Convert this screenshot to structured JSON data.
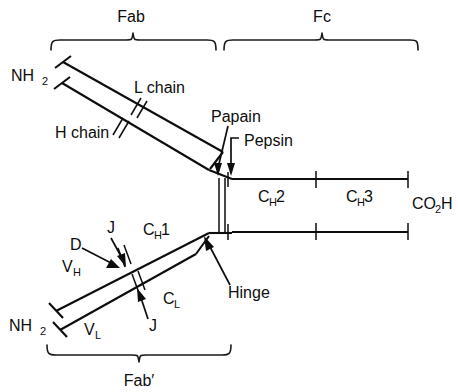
{
  "figure": {
    "type": "diagram",
    "background_color": "#ffffff",
    "line_color": "#0d0d0d"
  },
  "braces": {
    "fab": {
      "label": "Fab",
      "x_start": 50,
      "x_end": 216,
      "y": 40,
      "label_x": 131,
      "label_y": 20
    },
    "fc": {
      "label": "Fc",
      "x_start": 224,
      "x_end": 418,
      "y": 40,
      "label_x": 321,
      "label_y": 20
    },
    "fab_prime": {
      "label": "Fab′",
      "x_start": 46,
      "x_end": 231,
      "y": 355,
      "label_x": 139,
      "label_y": 388
    }
  },
  "terminals": {
    "n_terminus_upper": {
      "label": "NH",
      "subscript": "2",
      "x": 10,
      "y": 80
    },
    "n_terminus_lower": {
      "label": "NH",
      "subscript": "2",
      "x": 8,
      "y": 330
    },
    "c_terminus": {
      "label": "CO",
      "subscript": "2",
      "label_tail": "H",
      "x": 412,
      "y": 208
    }
  },
  "chain_labels": {
    "l_chain": {
      "text": "L chain",
      "x": 134,
      "y": 93
    },
    "h_chain": {
      "text": "H chain",
      "x": 55,
      "y": 138
    }
  },
  "domain_labels": [
    {
      "name": "V_H",
      "text": "V",
      "subscript": "H",
      "x": 62,
      "y": 271
    },
    {
      "name": "V_L",
      "text": "V",
      "subscript": "L",
      "x": 84,
      "y": 334
    },
    {
      "name": "C_H1",
      "text": "C",
      "subscript": "H",
      "suffix": "1",
      "x": 143,
      "y": 234
    },
    {
      "name": "C_L",
      "text": "C",
      "subscript": "L",
      "x": 163,
      "y": 303
    },
    {
      "name": "C_H2",
      "text": "C",
      "subscript": "H",
      "suffix": "2",
      "x": 258,
      "y": 201
    },
    {
      "name": "C_H3",
      "text": "C",
      "subscript": "H",
      "suffix": "3",
      "x": 346,
      "y": 201
    }
  ],
  "gene_segment_labels": [
    {
      "name": "D",
      "text": "D",
      "x": 70,
      "y": 249
    },
    {
      "name": "J-heavy",
      "text": "J",
      "x": 107,
      "y": 232
    },
    {
      "name": "J-light",
      "text": "J",
      "x": 149,
      "y": 330
    }
  ],
  "enzyme_labels": [
    {
      "name": "Papain",
      "text": "Papain",
      "x": 211,
      "y": 122
    },
    {
      "name": "Pepsin",
      "text": "Pepsin",
      "x": 244,
      "y": 146
    }
  ],
  "hinge_label": {
    "text": "Hinge",
    "x": 228,
    "y": 297
  },
  "annotations": {
    "disulfide_tick_count_heavy": 2,
    "disulfide_tick_count_light": 2,
    "hinge_disulfide_lines": 2,
    "fc_domain_count": 2
  }
}
